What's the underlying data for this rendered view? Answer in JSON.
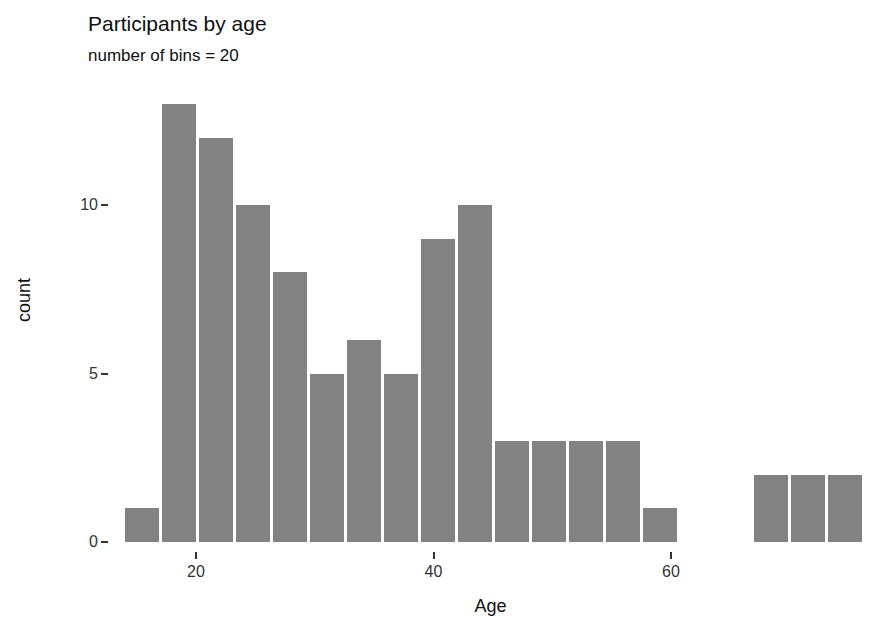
{
  "chart_data": {
    "type": "bar",
    "title": "Participants by age",
    "subtitle": "number of bins = 20",
    "xlabel": "Age",
    "ylabel": "count",
    "grid": false,
    "legend": null,
    "bin_count": 20,
    "bin_width": 2.75,
    "xlim": [
      14.5,
      69.5
    ],
    "ylim": [
      0,
      13
    ],
    "x_ticks": [
      20,
      40,
      60
    ],
    "x_tick_labels": [
      "20",
      "40",
      "60"
    ],
    "y_ticks": [
      0,
      5,
      10
    ],
    "y_tick_labels": [
      "0",
      "5",
      "10"
    ],
    "bar_color": "#828282",
    "categories": [
      "15.9",
      "18.6",
      "21.4",
      "24.1",
      "26.9",
      "29.6",
      "32.4",
      "35.1",
      "37.9",
      "40.6",
      "43.4",
      "46.1",
      "48.9",
      "51.6",
      "54.4",
      "57.1",
      "59.9",
      "62.6",
      "65.4",
      "68.1"
    ],
    "values": [
      1,
      13,
      12,
      10,
      8,
      5,
      6,
      5,
      9,
      10,
      3,
      3,
      3,
      3,
      1,
      0,
      0,
      2,
      2,
      2
    ]
  },
  "axis": {
    "y_title": "count",
    "x_title": "Age"
  }
}
